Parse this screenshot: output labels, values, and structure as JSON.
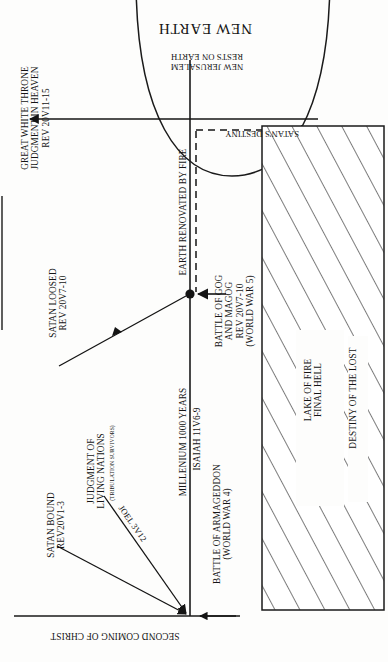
{
  "diagram": {
    "title": "NEW EARTH",
    "subtitle": "NEW JERUSALEM\nRESTS ON EARTH",
    "orientation_note": "rotated",
    "colors": {
      "ink": "#141414",
      "background": "#fdfdfc",
      "line": "#1a1a1a"
    },
    "labels": {
      "great_white_throne": "GREAT WHITE THRONE\nJUDGMENT IN HEAVEN\nREV 20v11-15",
      "earth_renovated": "EARTH RENOVATED BY FIRE",
      "satans_destiny": "SATAN'S DESTINY",
      "satan_loosed": "SATAN LOOSED\nREV 20v7-10",
      "battle_gog_magog": "BATTLE OF GOG\nAND MAGOG\nREV 20v7-10\n(WORLD WAR 5)",
      "millenium": "MILLENIUM 1000 YEARS",
      "millenium_ref": "ISAIAH 11v6-9",
      "satan_bound": "SATAN BOUND\nREV20v1-3",
      "judgment_living_nations": "JUDGMENT OF\nLIVING NATIONS",
      "judgment_living_nations_sub": "(TRIBULATION SURVIVORS)",
      "joel_ref": "JOEL 3v12",
      "battle_armageddon": "BATTLE OF ARMAGEDDON\n(WORLD WAR 4)",
      "second_coming": "SECOND COMING OF CHRIST",
      "lake_of_fire": "LAKE OF FIRE\nFINAL HELL",
      "destiny_of_the_lost": "DESTINY OF THE LOST"
    }
  }
}
